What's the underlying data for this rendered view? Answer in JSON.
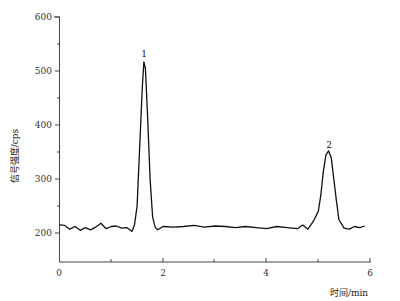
{
  "chart_data": {
    "type": "line",
    "title": "",
    "xlabel": "时间/min",
    "ylabel": "信号强度/cps",
    "xlim": [
      0,
      6
    ],
    "ylim": [
      146,
      600
    ],
    "x_ticks": [
      0,
      2,
      4,
      6
    ],
    "x_minor_ticks": [
      1,
      3,
      5
    ],
    "y_ticks": [
      200,
      300,
      400,
      500,
      600
    ],
    "grid": false,
    "legend": null,
    "series": [
      {
        "name": "chromatogram",
        "x": [
          0.0,
          0.1,
          0.2,
          0.3,
          0.4,
          0.5,
          0.6,
          0.7,
          0.8,
          0.9,
          1.0,
          1.1,
          1.2,
          1.3,
          1.4,
          1.45,
          1.5,
          1.55,
          1.6,
          1.63,
          1.66,
          1.7,
          1.75,
          1.8,
          1.85,
          1.9,
          2.0,
          2.2,
          2.4,
          2.6,
          2.8,
          3.0,
          3.2,
          3.4,
          3.6,
          3.8,
          4.0,
          4.2,
          4.4,
          4.6,
          4.7,
          4.8,
          4.9,
          5.0,
          5.05,
          5.1,
          5.15,
          5.2,
          5.25,
          5.3,
          5.35,
          5.4,
          5.5,
          5.6,
          5.7,
          5.8,
          5.9
        ],
        "values": [
          215,
          214,
          207,
          212,
          205,
          210,
          206,
          211,
          218,
          208,
          212,
          213,
          209,
          210,
          203,
          215,
          250,
          360,
          470,
          517,
          505,
          420,
          300,
          230,
          210,
          206,
          212,
          211,
          212,
          214,
          211,
          213,
          212,
          210,
          212,
          210,
          208,
          212,
          210,
          208,
          215,
          207,
          221,
          240,
          270,
          315,
          345,
          352,
          340,
          300,
          260,
          225,
          209,
          207,
          212,
          210,
          213
        ]
      }
    ],
    "annotations": [
      {
        "text": "1",
        "x": 1.63,
        "y": 517
      },
      {
        "text": "2",
        "x": 5.2,
        "y": 352
      }
    ]
  },
  "labels": {
    "x_axis_title": "时间/min",
    "y_axis_title": "信号强度/cps",
    "peak1": "1",
    "peak2": "2",
    "x0": "0",
    "x2": "2",
    "x4": "4",
    "x6": "6",
    "y200": "200",
    "y300": "300",
    "y400": "400",
    "y500": "500",
    "y600": "600"
  }
}
